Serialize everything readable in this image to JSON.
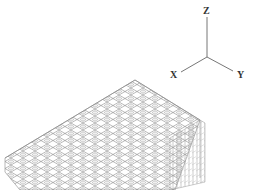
{
  "viewport": {
    "background": "#ffffff",
    "mesh_color": "#8a8a8a",
    "axis_color": "#777777"
  },
  "axis_triad": {
    "origin": [
      207,
      57
    ],
    "axes": [
      {
        "name": "Z",
        "label": "Z",
        "end": [
          207,
          17
        ],
        "label_pos": [
          204,
          13
        ]
      },
      {
        "name": "X",
        "label": "X",
        "end": [
          181,
          72
        ],
        "label_pos": [
          171,
          77
        ]
      },
      {
        "name": "Y",
        "label": "Y",
        "end": [
          233,
          71
        ],
        "label_pos": [
          237,
          77
        ]
      }
    ]
  },
  "mesh": {
    "type": "isometric-wireframe-block",
    "top_face": [
      [
        135,
        80
      ],
      [
        200,
        120
      ],
      [
        80,
        190
      ],
      [
        5,
        158
      ]
    ],
    "front_face": [
      [
        200,
        120
      ],
      [
        205,
        123
      ],
      [
        205,
        190
      ],
      [
        80,
        190
      ]
    ]
  }
}
